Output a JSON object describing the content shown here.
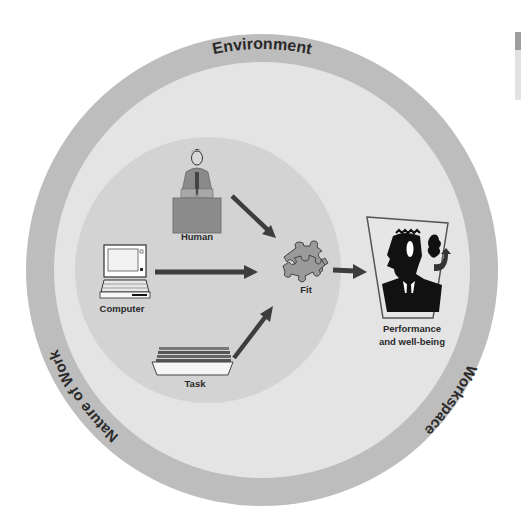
{
  "diagram": {
    "outer_ring": {
      "labels": {
        "top": "Environment",
        "left": "Nature of Work",
        "right": "Workspace"
      }
    },
    "inputs": [
      {
        "id": "human",
        "label": "Human",
        "icon": "person-at-desk-icon"
      },
      {
        "id": "computer",
        "label": "Computer",
        "icon": "laptop-icon"
      },
      {
        "id": "task",
        "label": "Task",
        "icon": "paper-tray-icon"
      }
    ],
    "center": {
      "label": "Fit",
      "icon": "puzzle-pieces-icon"
    },
    "output": {
      "label_line1": "Performance",
      "label_line2": "and well-being",
      "icon": "businessman-portrait-icon"
    },
    "colors": {
      "outer_band": "#bdbdbd",
      "middle_area": "#e4e4e4",
      "inner_disc": "#d3d3d3",
      "arrow": "#3d3d3d",
      "desk": "#8c8c8c",
      "puzzle": "#9a9a9a",
      "text": "#2a2a2a"
    }
  }
}
